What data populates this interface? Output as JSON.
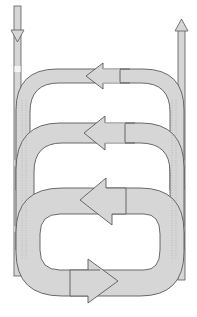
{
  "diagram": {
    "title": "",
    "colors": {
      "fill": "#d6d6d6",
      "stroke": "#5a5a5a",
      "highlight": "#f2f2f2",
      "background": "#ffffff"
    },
    "elements": [
      {
        "id": "inflow-arrow",
        "type": "arrow",
        "direction": "down",
        "label": ""
      },
      {
        "id": "outflow-arrow",
        "type": "arrow",
        "direction": "up",
        "label": ""
      },
      {
        "id": "loop-1",
        "type": "loop-arc",
        "arrow_direction": "left",
        "label": ""
      },
      {
        "id": "loop-2",
        "type": "loop-arc",
        "arrow_direction": "left",
        "label": ""
      },
      {
        "id": "loop-3",
        "type": "closed-loop",
        "arrow_directions": [
          "left",
          "right"
        ],
        "label": ""
      }
    ]
  }
}
